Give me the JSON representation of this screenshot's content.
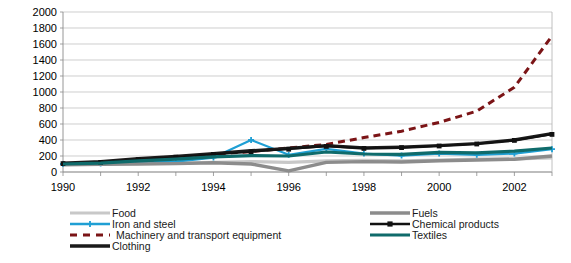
{
  "chart_data": {
    "type": "line",
    "title": "",
    "xlabel": "",
    "ylabel": "",
    "x": [
      1990,
      1991,
      1992,
      1993,
      1994,
      1995,
      1996,
      1997,
      1998,
      1999,
      2000,
      2001,
      2002,
      2003
    ],
    "xlim": [
      1990,
      2003
    ],
    "ylim": [
      0,
      2000
    ],
    "ytick_step": 200,
    "yticks": [
      0,
      200,
      400,
      600,
      800,
      1000,
      1200,
      1400,
      1600,
      1800,
      2000
    ],
    "ytick_labels": [
      "0",
      "200",
      "400",
      "600",
      "800",
      "1000",
      "1200",
      "1400",
      "1600",
      "1800",
      "2000"
    ],
    "xticks": [
      1990,
      1991,
      1992,
      1993,
      1994,
      1995,
      1996,
      1997,
      1998,
      1999,
      2000,
      2001,
      2002,
      2003
    ],
    "xtick_labels": [
      "1990",
      "",
      "1992",
      "",
      "1994",
      "",
      "1996",
      "",
      "1998",
      "",
      "2000",
      "",
      "2002",
      ""
    ],
    "grid": true,
    "grid_axis": "y",
    "legend_position": "bottom",
    "legend_columns": 2,
    "series": [
      {
        "name": "Food",
        "color": "#c8c8c8",
        "width": 3.2,
        "dash": "",
        "marker": "none",
        "values": [
          95,
          100,
          110,
          110,
          120,
          130,
          120,
          140,
          145,
          140,
          150,
          160,
          165,
          175
        ]
      },
      {
        "name": "Iron and steel",
        "color": "#1f9fd4",
        "width": 2.2,
        "dash": "",
        "marker": "cross",
        "values": [
          100,
          105,
          125,
          130,
          180,
          400,
          215,
          290,
          230,
          205,
          230,
          215,
          230,
          285
        ]
      },
      {
        "name": "Machinery and transport equipment",
        "color": "#7b1416",
        "width": 3.0,
        "dash": "7,5",
        "marker": "none",
        "values": [
          100,
          115,
          140,
          170,
          220,
          255,
          300,
          345,
          430,
          510,
          620,
          760,
          1060,
          1700
        ]
      },
      {
        "name": "Clothing",
        "color": "#1a1a1a",
        "width": 3.4,
        "dash": "",
        "marker": "none",
        "values": [
          110,
          130,
          165,
          195,
          230,
          265,
          295,
          330,
          300,
          310,
          330,
          355,
          400,
          480
        ]
      },
      {
        "name": "Fuels",
        "color": "#8c8c8c",
        "width": 3.4,
        "dash": "",
        "marker": "none",
        "values": [
          90,
          95,
          100,
          105,
          115,
          100,
          15,
          120,
          130,
          125,
          140,
          150,
          160,
          200
        ]
      },
      {
        "name": "Chemical products",
        "color": "#111111",
        "width": 1.6,
        "dash": "",
        "marker": "square",
        "values": [
          105,
          120,
          155,
          185,
          220,
          250,
          285,
          320,
          295,
          305,
          325,
          350,
          395,
          470
        ]
      },
      {
        "name": "Textiles",
        "color": "#0f6b6b",
        "width": 3.2,
        "dash": "",
        "marker": "none",
        "values": [
          100,
          110,
          140,
          160,
          190,
          205,
          200,
          250,
          225,
          220,
          245,
          240,
          260,
          300
        ]
      }
    ]
  },
  "legend": {
    "entries": [
      {
        "label": "Food",
        "column": 0,
        "row": 0
      },
      {
        "label": "Iron and steel",
        "column": 0,
        "row": 1
      },
      {
        "label": "Machinery and transport equipment",
        "column": 0,
        "row": 2
      },
      {
        "label": "Clothing",
        "column": 0,
        "row": 3
      },
      {
        "label": "Fuels",
        "column": 1,
        "row": 0
      },
      {
        "label": "Chemical products",
        "column": 1,
        "row": 1
      },
      {
        "label": "Textiles",
        "column": 1,
        "row": 2
      }
    ]
  },
  "colors": {
    "background": "#ffffff",
    "gridline": "#b9b9b9",
    "axis": "#8a8a8a",
    "text": "#000000"
  }
}
